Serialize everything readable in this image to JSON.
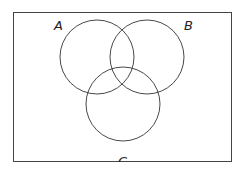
{
  "diagram": {
    "type": "venn",
    "universe": {
      "x": 13,
      "y": 12,
      "width": 219,
      "height": 150
    },
    "sets": [
      {
        "label": "A",
        "cx": 97,
        "cy": 57,
        "r": 37,
        "label_x": 55,
        "label_y": 30
      },
      {
        "label": "B",
        "cx": 147,
        "cy": 57,
        "r": 37,
        "label_x": 184,
        "label_y": 30
      },
      {
        "label": "C",
        "cx": 123,
        "cy": 104,
        "r": 37,
        "label_x": 119,
        "label_y": 164
      }
    ],
    "stroke_color": "#333333"
  }
}
